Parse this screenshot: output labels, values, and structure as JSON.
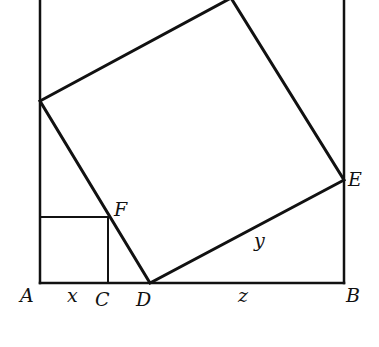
{
  "diagram": {
    "stroke_color": "#111111",
    "background": "#ffffff",
    "points": {
      "A": {
        "label": "A",
        "x": 40,
        "y": 283
      },
      "B": {
        "label": "B",
        "x": 344,
        "y": 283
      },
      "C": {
        "label": "C",
        "x": 108,
        "y": 283
      },
      "D": {
        "label": "D",
        "x": 150,
        "y": 283
      },
      "E": {
        "label": "E",
        "x": 344,
        "y": 180
      },
      "F": {
        "label": "F",
        "x": 108,
        "y": 217
      },
      "G": {
        "x": 40,
        "y": 101
      },
      "H": {
        "x": 231,
        "y": -2
      }
    },
    "segment_labels": {
      "x": "x",
      "y": "y",
      "z": "z"
    }
  }
}
